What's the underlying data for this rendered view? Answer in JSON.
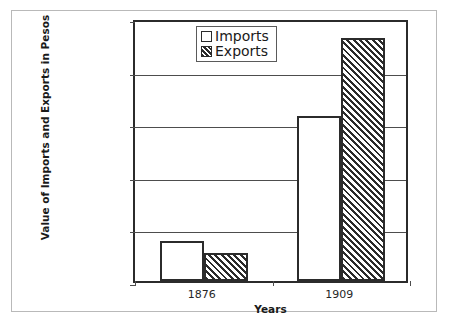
{
  "chart_data": {
    "type": "bar",
    "title": "",
    "xlabel": "Years",
    "ylabel": "Value of Imports and Exports in Pesos",
    "categories": [
      "1876",
      "1909"
    ],
    "series": [
      {
        "name": "Imports",
        "values": [
          38000000,
          157000000
        ],
        "style": "solid-white"
      },
      {
        "name": "Exports",
        "values": [
          27000000,
          231000000
        ],
        "style": "diagonal-hatch"
      }
    ],
    "ylim": [
      0,
      250000000
    ],
    "ytick_values": [
      0,
      50000000,
      100000000,
      150000000,
      200000000,
      250000000
    ],
    "ytick_labels": [
      "0",
      "50,000,000",
      "100,000,000",
      "150,000,000",
      "200,000,000",
      "250,000,000"
    ],
    "grid": true,
    "legend_position": "upper-center",
    "legend_entries": [
      "Imports",
      "Exports"
    ]
  },
  "colors": {
    "axis": "#2b2b2b",
    "grid": "#4d4d4d",
    "frame": "#b9b9b9",
    "background": "#ffffff",
    "hatch": "#2b2b2b"
  }
}
